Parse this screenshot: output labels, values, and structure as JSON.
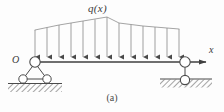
{
  "figure": {
    "caption": "(a)",
    "load_label": "q(x)",
    "origin_label": "O",
    "axis_label": "x",
    "colors": {
      "line": "#4a4a4a",
      "arrow": "#555555",
      "profile": "#8a8a8a",
      "hatch": "#5a5a5a",
      "background": "#fdfdfd",
      "node_fill": "#ffffff"
    }
  },
  "diagram_data": {
    "type": "structural-beam-diagram",
    "description": "Simply supported beam with non-uniform distributed load q(x)",
    "beam": {
      "x_start": 35,
      "x_end": 185,
      "y": 62
    },
    "axis": {
      "label": "x",
      "direction": "right",
      "arrow_tip_x": 214,
      "y": 62
    },
    "origin": {
      "label": "O",
      "x": 35,
      "y": 62
    },
    "distributed_load": {
      "label": "q(x)",
      "arrow_count": 13,
      "arrow_x_positions": [
        35,
        47,
        59,
        71,
        83,
        95,
        107,
        119,
        131,
        143,
        155,
        167,
        179
      ],
      "profile_points": [
        {
          "x": 35,
          "y": 30
        },
        {
          "x": 59,
          "y": 25
        },
        {
          "x": 83,
          "y": 21
        },
        {
          "x": 101,
          "y": 18
        },
        {
          "x": 107,
          "y": 17
        },
        {
          "x": 119,
          "y": 23
        },
        {
          "x": 143,
          "y": 26
        },
        {
          "x": 167,
          "y": 28
        },
        {
          "x": 179,
          "y": 29
        }
      ]
    },
    "supports": [
      {
        "name": "left-support",
        "type": "pin-on-rockers",
        "x": 35,
        "pin_circle_y": 62,
        "rocker_circles": [
          {
            "x": 23,
            "y": 79
          },
          {
            "x": 47,
            "y": 79
          }
        ],
        "ground_y": 84,
        "ground_x_start": 8,
        "ground_x_end": 62
      },
      {
        "name": "right-support",
        "type": "roller-in-ground",
        "x": 185,
        "pin_circle_y": 62,
        "roller_circle": {
          "x": 185,
          "y": 80
        },
        "ground_y": 80,
        "ground_x_start": 160,
        "ground_x_end": 212
      }
    ]
  }
}
